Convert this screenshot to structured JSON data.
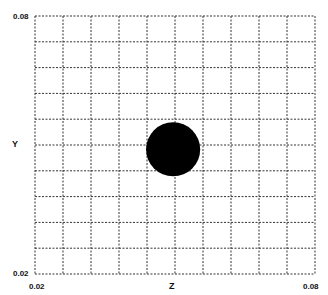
{
  "chart_data": {
    "type": "scatter",
    "title": "",
    "xlabel": "Z",
    "ylabel": "Y",
    "xlim": [
      0.02,
      0.08
    ],
    "ylim": [
      0.02,
      0.08
    ],
    "x_ticks": [
      "0.02",
      "0.08"
    ],
    "y_ticks": [
      "0.08",
      "0.02"
    ],
    "grid": true,
    "grid_style": "dotted",
    "grid_divisions": {
      "x": 10,
      "y": 10
    },
    "series": [
      {
        "name": "particle",
        "shape": "filled-circle",
        "color": "#000000",
        "points": [
          {
            "x": 0.0496,
            "y": 0.049,
            "radius": 0.0058
          }
        ]
      }
    ]
  },
  "labels": {
    "y_top": "0.08",
    "y_bottom": "0.02",
    "x_left": "0.02",
    "x_right": "0.08",
    "x_axis": "Z",
    "y_axis": "Y"
  }
}
